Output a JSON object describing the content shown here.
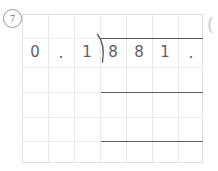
{
  "worksheet": {
    "problem_number": "7",
    "type": "long-division",
    "divisor_digits": [
      "0",
      ".",
      "1",
      "8"
    ],
    "dividend_digits": [
      "8",
      "1",
      "."
    ],
    "division_bracket_icon": "division-bracket-icon",
    "edge_glyph": "(",
    "rules": [
      {
        "label": "quotient-vinculum"
      },
      {
        "label": "first-subtraction-rule"
      },
      {
        "label": "second-subtraction-rule"
      }
    ],
    "colors": {
      "ink": "#5e5e62",
      "rule": "#5c5c60",
      "grid": "#e8e8ea",
      "badge": "#9a9a9a",
      "paper": "#ffffff"
    }
  }
}
